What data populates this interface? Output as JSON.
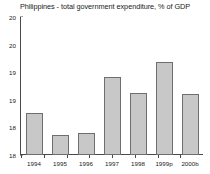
{
  "chart_data": {
    "type": "bar",
    "title": "Philippines - total government expenditure, % of GDP",
    "xlabel": "",
    "ylabel": "",
    "categories": [
      "1994",
      "1995",
      "1996",
      "1997",
      "1998",
      "1999p",
      "2000b"
    ],
    "values": [
      18.77,
      18.36,
      18.4,
      19.41,
      19.13,
      19.68,
      19.11
    ],
    "series": [
      {
        "name": "total government expenditure, % of GDP",
        "values": [
          18.77,
          18.36,
          18.4,
          19.41,
          19.13,
          19.68,
          19.11
        ]
      }
    ],
    "ylim": [
      18,
      20.5
    ],
    "yticks": [
      18,
      18.5,
      19,
      19.5,
      20,
      20.5
    ],
    "ytick_labels": [
      "18",
      "18",
      "19",
      "19",
      "20",
      "20"
    ],
    "grid": false,
    "legend": false,
    "legend_position": "none",
    "bar_color": "#c8c8c8",
    "bar_edge_color": "#6e6e6e",
    "axis_color": "#4a4a4a",
    "background_color": "#ffffff"
  }
}
